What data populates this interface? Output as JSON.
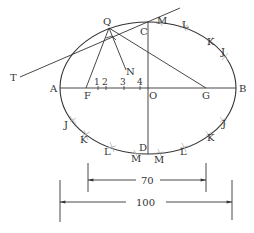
{
  "diagram": {
    "colors": {
      "line": "#333333",
      "arc": "#aaaaaa",
      "background": "#ffffff"
    },
    "points": {
      "Q": "Q",
      "T": "T",
      "C": "C",
      "A": "A",
      "B": "B",
      "O": "O",
      "F": "F",
      "G": "G",
      "N": "N",
      "D": "D"
    },
    "divisions": [
      "1",
      "2",
      "3",
      "4"
    ],
    "arc_labels": {
      "top_right": [
        "M",
        "L",
        "K",
        "J"
      ],
      "bottom_left": [
        "J",
        "K",
        "L",
        "M"
      ],
      "bottom_right": [
        "M",
        "L",
        "K",
        "J"
      ]
    },
    "dimensions": {
      "minor": {
        "value": "70"
      },
      "major": {
        "value": "100"
      }
    }
  }
}
